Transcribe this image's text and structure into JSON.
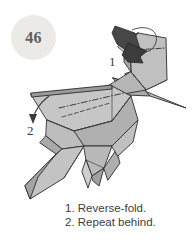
{
  "page": {
    "width": 193,
    "height": 243,
    "background": "#ffffff",
    "kind": "origami-instruction-step"
  },
  "step_badge": {
    "number": "46",
    "shape": "circle",
    "fill": "#eceae6",
    "text_color": "#5f5f5f"
  },
  "diagram": {
    "paper_light": "#e6e6e4",
    "paper_mid": "#b8b8b8",
    "paper_shadow": "#9d9d9d",
    "arrow_dark": "#474747",
    "outline": "#2b2b2b",
    "fold_line": "#3a3a3a"
  },
  "callouts": [
    {
      "label": "1",
      "refers_to": "reverse-fold-arrow"
    },
    {
      "label": "2",
      "refers_to": "repeat-behind-arrow"
    }
  ],
  "caption": {
    "line_1": "1. Reverse-fold.",
    "line_2": "2. Repeat behind."
  }
}
